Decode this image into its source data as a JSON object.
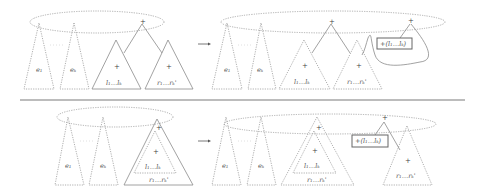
{
  "diagram": {
    "type": "tree-rewriting-illustration",
    "rows": [
      {
        "name": "top",
        "before": {
          "subtrees": [
            {
              "label": "e₁"
            },
            {
              "label": "eₖ"
            },
            {
              "label": "l₁…lₖ",
              "root_symbol": "+"
            },
            {
              "label": "r₁…rₖ'",
              "root_symbol": "+"
            }
          ],
          "root_symbol": "+"
        },
        "after": {
          "subtrees": [
            {
              "label": "e₁"
            },
            {
              "label": "eₖ"
            },
            {
              "label": "l₁…lₖ",
              "root_symbol": "+"
            },
            {
              "label": "r₁…rₖ'",
              "root_symbol": "+"
            }
          ],
          "root_symbol": "+",
          "new_root_symbol": "+",
          "boxed_label": "+(l₁…lₖ)"
        }
      },
      {
        "name": "bottom",
        "before": {
          "subtrees": [
            {
              "label": "e₁"
            },
            {
              "label": "eₖ"
            },
            {
              "outer_label": "r₁…rₖ'",
              "inner_label": "l₁…lₖ",
              "outer_root": "+",
              "inner_root": "+"
            }
          ]
        },
        "after": {
          "subtrees": [
            {
              "label": "e₁"
            },
            {
              "label": "eₖ"
            },
            {
              "outer_label": "r₁…rₖ'",
              "inner_label": "l₁…lₖ",
              "outer_root": "+",
              "inner_root": "+"
            },
            {
              "label": "r₁…rₖ'",
              "root_symbol": "+"
            }
          ],
          "new_root_symbol": "+",
          "boxed_label": "+(l₁…lₖ)"
        }
      }
    ],
    "arrow": "→",
    "plus": "+"
  }
}
